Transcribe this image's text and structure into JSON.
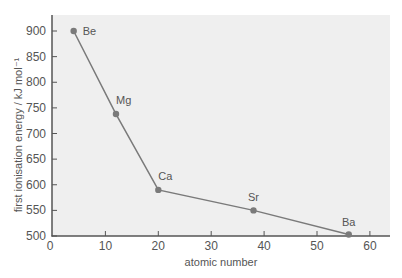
{
  "chart_data": {
    "type": "line",
    "title": "",
    "xlabel": "atomic number",
    "ylabel": "first ionisation energy / kJ mol⁻¹",
    "xlim": [
      0,
      63
    ],
    "ylim": [
      500,
      925
    ],
    "xticks": [
      0,
      10,
      20,
      30,
      40,
      50,
      60
    ],
    "yticks": [
      500,
      550,
      600,
      650,
      700,
      750,
      800,
      850,
      900
    ],
    "grid": false,
    "legend": null,
    "series": [
      {
        "name": "Group 2",
        "points": [
          {
            "label": "Be",
            "x": 4,
            "y": 900
          },
          {
            "label": "Mg",
            "x": 12,
            "y": 738
          },
          {
            "label": "Ca",
            "x": 20,
            "y": 590
          },
          {
            "label": "Sr",
            "x": 38,
            "y": 550
          },
          {
            "label": "Ba",
            "x": 56,
            "y": 503
          }
        ]
      }
    ]
  },
  "colors": {
    "plot_bg": "#efefef",
    "axis": "#555555",
    "line": "#7a7a7a",
    "marker": "#7a7a7a"
  }
}
